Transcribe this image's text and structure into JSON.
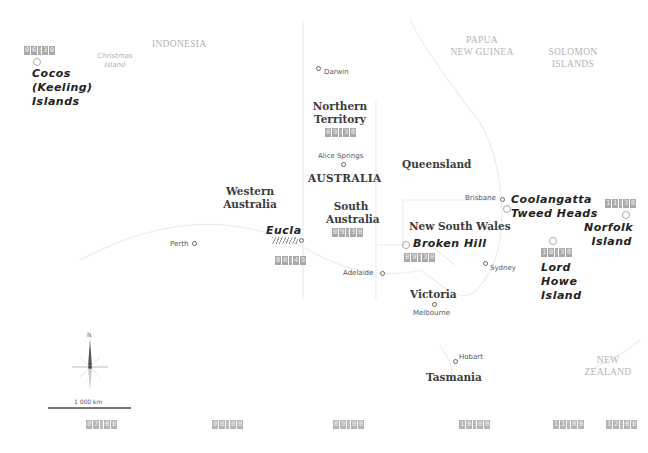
{
  "map": {
    "type": "time-zone-map",
    "subject": "Australia time zones",
    "countries": [
      {
        "id": "indonesia",
        "label": "INDONESIA"
      },
      {
        "id": "png",
        "label_line1": "PAPUA",
        "label_line2": "NEW GUINEA"
      },
      {
        "id": "solomon",
        "label_line1": "SOLOMON",
        "label_line2": "ISLANDS"
      },
      {
        "id": "nz",
        "label_line1": "NEW",
        "label_line2": "ZEALAND"
      },
      {
        "id": "australia",
        "label": "AUSTRALIA"
      }
    ],
    "states": {
      "nt": {
        "line1": "Northern",
        "line2": "Territory",
        "time": "09:30"
      },
      "wa": {
        "line1": "Western",
        "line2": "Australia"
      },
      "sa": {
        "line1": "South",
        "line2": "Australia",
        "time": "09:30"
      },
      "qld": {
        "line1": "Queensland"
      },
      "nsw": {
        "line1": "New South Wales"
      },
      "vic": {
        "line1": "Victoria"
      },
      "tas": {
        "line1": "Tasmania"
      }
    },
    "cities": {
      "darwin": "Darwin",
      "alice": "Alice Springs",
      "perth": "Perth",
      "adelaide": "Adelaide",
      "brisbane": "Brisbane",
      "sydney": "Sydney",
      "melbourne": "Melbourne",
      "hobart": "Hobart"
    },
    "special_places": {
      "cocos": {
        "line1": "Cocos",
        "line2": "(Keeling)",
        "line3": "Islands",
        "time": "06:30"
      },
      "christmas": {
        "line1": "Christmas",
        "line2": "Island"
      },
      "eucla": {
        "label": "Eucla",
        "time": "08:45"
      },
      "broken_hill": {
        "label": "Broken Hill",
        "time": "09:30"
      },
      "coolangatta": {
        "line1": "Coolangatta",
        "line2": "Tweed Heads"
      },
      "lord_howe": {
        "line1": "Lord",
        "line2": "Howe",
        "line3": "Island",
        "time": "10:30"
      },
      "norfolk": {
        "line1": "Norfolk",
        "line2": "Island",
        "time": "11:30"
      }
    },
    "compass": {
      "north_label": "N"
    },
    "scale_bar": {
      "label": "1 000 km"
    },
    "bottom_times": [
      "07:00",
      "08:00",
      "09:00",
      "10:00",
      "11:00",
      "12:00"
    ],
    "colors": {
      "time_badge": "#a8a8a8",
      "text_dark": "#222222",
      "country_label": "#b4b4b4"
    }
  }
}
